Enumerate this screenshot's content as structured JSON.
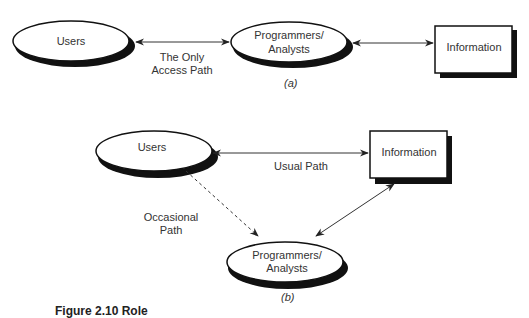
{
  "diagram_a": {
    "caption": "(a)",
    "nodes": {
      "users": "Users",
      "programmers_line1": "Programmers/",
      "programmers_line2": "Analysts",
      "information": "Information"
    },
    "edges": {
      "users_programmers_line1": "The Only",
      "users_programmers_line2": "Access Path"
    }
  },
  "diagram_b": {
    "caption": "(b)",
    "nodes": {
      "users": "Users",
      "programmers_line1": "Programmers/",
      "programmers_line2": "Analysts",
      "information": "Information"
    },
    "edges": {
      "usual_path": "Usual Path",
      "occasional_line1": "Occasional",
      "occasional_line2": "Path"
    }
  },
  "figure_caption": "Figure 2.10 Role"
}
